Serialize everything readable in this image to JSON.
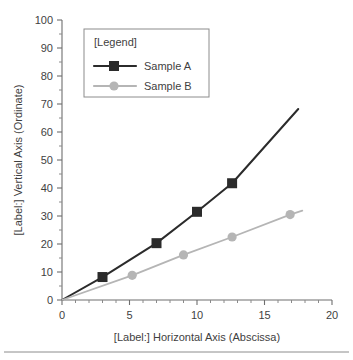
{
  "chart_data": {
    "type": "line",
    "title": "",
    "xlabel": "[Label:] Horizontal Axis (Abscissa)",
    "ylabel": "[Label:] Vertical Axis (Ordinate)",
    "xlim": [
      0,
      20
    ],
    "ylim": [
      0,
      100
    ],
    "xticks": [
      0,
      5,
      10,
      15,
      20
    ],
    "yticks": [
      0,
      10,
      20,
      30,
      40,
      50,
      60,
      70,
      80,
      90,
      100
    ],
    "xtick_labels": [
      "0",
      "5",
      "10",
      "15",
      "20"
    ],
    "ytick_labels": [
      "0",
      "10",
      "20",
      "30",
      "40",
      "50",
      "60",
      "70",
      "80",
      "90",
      "100"
    ],
    "x_minor_tick_step": 1,
    "y_minor_tick_step": 5,
    "grid": false,
    "legend_position": "upper-left-inside",
    "legend_title": "[Legend]",
    "series": [
      {
        "name": "Sample A",
        "color": "#2b2b2b",
        "marker": "square",
        "x": [
          0,
          3,
          7,
          10,
          12.6,
          17.5
        ],
        "y": [
          0,
          8.2,
          20.3,
          31.5,
          41.7,
          68.2
        ]
      },
      {
        "name": "Sample B",
        "color": "#b5b5b5",
        "marker": "circle",
        "x": [
          0,
          5.2,
          9,
          12.6,
          16.9,
          17.8
        ],
        "y": [
          0,
          8.8,
          16.1,
          22.5,
          30.5,
          31.9
        ]
      }
    ]
  },
  "legend": {
    "title": "[Legend]",
    "entries": [
      {
        "label": "Sample A",
        "color": "#2b2b2b",
        "marker": "square"
      },
      {
        "label": "Sample B",
        "color": "#b5b5b5",
        "marker": "circle"
      }
    ]
  },
  "axes": {
    "y_title": "[Label:] Vertical Axis (Ordinate)",
    "x_title": "[Label:] Horizontal Axis (Abscissa)"
  }
}
